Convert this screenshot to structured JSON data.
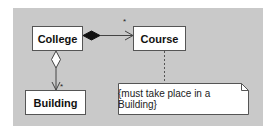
{
  "diagram": {
    "type": "UML class diagram",
    "background_color": "#c9c9c9",
    "classes": [
      {
        "id": "college",
        "label": "College"
      },
      {
        "id": "course",
        "label": "Course"
      },
      {
        "id": "building",
        "label": "Building"
      }
    ],
    "note": {
      "text": "{must take place in a Building}",
      "attached_to": "course"
    },
    "relationships": [
      {
        "type": "composition",
        "from": "college",
        "to": "course",
        "navigable": true,
        "target_multiplicity": "*"
      },
      {
        "type": "aggregation",
        "from": "college",
        "to": "building",
        "navigable": true,
        "target_multiplicity": "*"
      }
    ]
  }
}
